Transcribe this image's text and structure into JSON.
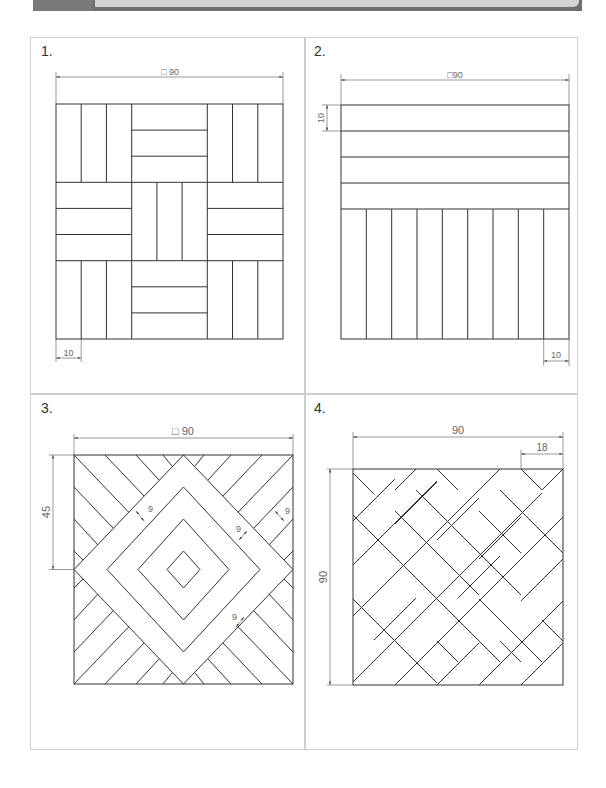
{
  "header": {
    "colors": {
      "bar": "#6e6e6e",
      "panel": "#d4d4d4"
    }
  },
  "panels": [
    {
      "label": "1.",
      "pattern": "basket-weave-3x3",
      "dims": {
        "overall": "□ 90",
        "strip": "10"
      }
    },
    {
      "label": "2.",
      "pattern": "horizontal-top-vertical-bottom",
      "dims": {
        "overall": "□90",
        "strip_vertical": "10",
        "strip_horizontal": "10"
      }
    },
    {
      "label": "3.",
      "pattern": "concentric-diamonds-herringbone",
      "dims": {
        "overall": "□ 90",
        "half": "45",
        "strips": [
          "9",
          "9",
          "9",
          "9"
        ]
      }
    },
    {
      "label": "4.",
      "pattern": "diagonal-basket-weave",
      "dims": {
        "width": "90",
        "height": "90",
        "strip": "18"
      }
    }
  ]
}
